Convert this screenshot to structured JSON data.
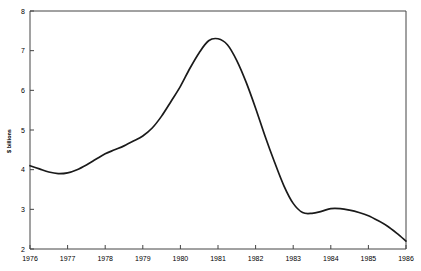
{
  "chart_data": {
    "type": "line",
    "title": "",
    "subtitle": "",
    "xlabel": "",
    "ylabel": "$ billions",
    "xlim": [
      1976,
      1986
    ],
    "ylim": [
      2,
      8
    ],
    "grid": false,
    "legend": null,
    "x_ticks": [
      "1976",
      "1977",
      "1978",
      "1979",
      "1980",
      "1981",
      "1982",
      "1983",
      "1984",
      "1985",
      "1986"
    ],
    "x_tick_values": [
      1976,
      1977,
      1978,
      1979,
      1980,
      1981,
      1982,
      1983,
      1984,
      1985,
      1986
    ],
    "y_ticks": [
      "2",
      "3",
      "4",
      "5",
      "6",
      "7",
      "8"
    ],
    "y_tick_values": [
      2,
      3,
      4,
      5,
      6,
      7,
      8
    ],
    "series": [
      {
        "name": "$ billions",
        "color": "#1a1a1a",
        "x": [
          1976.0,
          1976.25,
          1976.5,
          1976.75,
          1977.0,
          1977.25,
          1977.5,
          1977.75,
          1978.0,
          1978.25,
          1978.5,
          1978.75,
          1979.0,
          1979.25,
          1979.5,
          1979.75,
          1980.0,
          1980.25,
          1980.5,
          1980.75,
          1981.0,
          1981.25,
          1981.5,
          1981.75,
          1982.0,
          1982.25,
          1982.5,
          1982.75,
          1983.0,
          1983.25,
          1983.5,
          1983.75,
          1984.0,
          1984.25,
          1984.5,
          1984.75,
          1985.0,
          1985.25,
          1985.5,
          1985.75,
          1986.0
        ],
        "y": [
          4.1,
          4.02,
          3.94,
          3.9,
          3.92,
          4.0,
          4.12,
          4.26,
          4.4,
          4.5,
          4.6,
          4.72,
          4.85,
          5.05,
          5.35,
          5.72,
          6.1,
          6.55,
          6.95,
          7.25,
          7.3,
          7.15,
          6.75,
          6.2,
          5.55,
          4.85,
          4.2,
          3.6,
          3.15,
          2.92,
          2.9,
          2.95,
          3.02,
          3.02,
          2.98,
          2.92,
          2.84,
          2.72,
          2.58,
          2.4,
          2.2
        ]
      }
    ],
    "annotations": [
      {
        "label": "peak",
        "x": 1981.0,
        "y": 7.3
      },
      {
        "label": "early-trough",
        "x": 1976.75,
        "y": 3.9
      },
      {
        "label": "secondary-trough",
        "x": 1983.5,
        "y": 2.9
      },
      {
        "label": "secondary-peak",
        "x": 1984.0,
        "y": 3.02
      },
      {
        "label": "end",
        "x": 1986.0,
        "y": 2.2
      }
    ]
  }
}
